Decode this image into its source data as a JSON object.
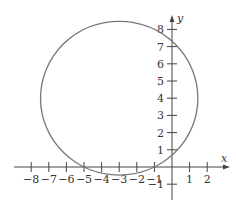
{
  "chart_data": {
    "type": "scatter",
    "title": "",
    "xlabel": "x",
    "ylabel": "y",
    "xlim": [
      -9,
      3
    ],
    "ylim": [
      -1.5,
      9
    ],
    "grid": false,
    "x_ticks": [
      -8,
      -7,
      -6,
      -5,
      -4,
      -3,
      -2,
      -1,
      1,
      2
    ],
    "x_tick_labels": [
      "−8",
      "−7",
      "−6",
      "−5",
      "−4",
      "−3",
      "−2",
      "−1",
      "1",
      "2"
    ],
    "y_ticks": [
      -1,
      1,
      2,
      3,
      4,
      5,
      6,
      7,
      8
    ],
    "y_tick_labels": [
      "−1",
      "1",
      "2",
      "3",
      "4",
      "5",
      "6",
      "7",
      "8"
    ],
    "series": [
      {
        "name": "circle",
        "shape": "circle",
        "center": [
          -3,
          4
        ],
        "radius": 4.47,
        "x_intercepts": [
          -5,
          -1
        ],
        "y_intercepts": [
          0.68,
          7.32
        ],
        "color": "#777777"
      }
    ]
  }
}
